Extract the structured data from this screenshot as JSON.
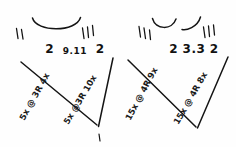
{
  "image": {
    "kind": "handwritten-sketch",
    "medium": "black ink on white paper",
    "width": 236,
    "height": 147,
    "ink_color": "#141414",
    "background_color": "#fefefe"
  },
  "groups": [
    {
      "id": "left",
      "tick_marks_left": 2,
      "tick_marks_right": 3,
      "arc_count": 1,
      "digits": {
        "outer_left": "2",
        "center": "9.11",
        "outer_right": "2"
      },
      "full_text": "2  9.11  2",
      "labels": [
        {
          "id": "left-leg",
          "text": "5x @ 3R 4x",
          "reps": "5x",
          "at": "@",
          "code": "3R",
          "trailing": "4x"
        },
        {
          "id": "right-leg",
          "text": "5x @3R 10x",
          "reps": "5x",
          "at": "@",
          "code": "3R",
          "trailing": "10x"
        }
      ]
    },
    {
      "id": "right",
      "tick_marks_left": 3,
      "tick_marks_right": 3,
      "arc_count": 2,
      "digits": {
        "outer_left": "2",
        "center": "3.3",
        "outer_right": "2"
      },
      "full_text": "2  3.3  2",
      "labels": [
        {
          "id": "left-leg",
          "text": "15x @ 4R 9x",
          "reps": "15x",
          "at": "@",
          "code": "4R",
          "trailing": "9x"
        },
        {
          "id": "right-leg",
          "text": "15x @ 4R 8x",
          "reps": "15x",
          "at": "@",
          "code": "4R",
          "trailing": "8x"
        }
      ]
    }
  ],
  "marks": {
    "stray_mark_below_left_vertex": "'"
  }
}
